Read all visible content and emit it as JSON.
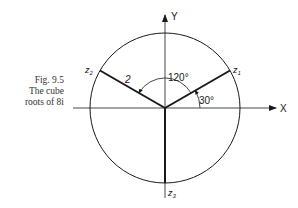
{
  "caption": {
    "line1": "Fig. 9.5",
    "line2": "The cube",
    "line3": "roots of 8i"
  },
  "diagram": {
    "axes": {
      "x_label": "X",
      "y_label": "Y"
    },
    "circle": {
      "radius_label": "2"
    },
    "roots": [
      {
        "label": "z1",
        "angle_deg": 30
      },
      {
        "label": "z2",
        "angle_deg": 150
      },
      {
        "label": "z3",
        "angle_deg": 270
      }
    ],
    "angle_labels": {
      "first": "30°",
      "separation": "120°"
    }
  }
}
